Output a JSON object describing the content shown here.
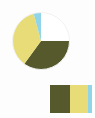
{
  "canvas": {
    "width": 95,
    "height": 118,
    "background_color": "#fdfdfd"
  },
  "pie_chart": {
    "name": "pie-chart",
    "center_x": 29,
    "center_y": 29,
    "radius": 28.5,
    "outline_color": "#f2f2f2"
  },
  "color_swatch_block": {
    "name": "color-swatch-block",
    "bands": [
      {
        "name": "swatch-olive",
        "color": "#55592b",
        "width_pct": 47.6
      },
      {
        "name": "swatch-yellow",
        "color": "#e8dc78",
        "width_pct": 42.9
      },
      {
        "name": "swatch-cyan",
        "color": "#8fd4e8",
        "width_pct": 9.5
      }
    ]
  },
  "chart_data": {
    "type": "pie",
    "title": "",
    "labels": [
      "Unfilled",
      "Olive",
      "Yellow",
      "Cyan"
    ],
    "values": [
      25,
      35,
      36,
      4
    ],
    "colors": [
      "#ffffff",
      "#55592b",
      "#e8dc78",
      "#8fd4e8"
    ],
    "slices": [
      {
        "label": "Unfilled",
        "color": "#ffffff",
        "value": 25,
        "start_angle": 0,
        "end_angle": 90
      },
      {
        "label": "Olive",
        "color": "#55592b",
        "value": 35,
        "start_angle": 90,
        "end_angle": 216
      },
      {
        "label": "Yellow",
        "color": "#e8dc78",
        "value": 36,
        "start_angle": 216,
        "end_angle": 345
      },
      {
        "label": "Cyan",
        "color": "#8fd4e8",
        "value": 4,
        "start_angle": 345,
        "end_angle": 360
      }
    ],
    "start_angle_deg": 0,
    "direction": "clockwise",
    "legend": "none",
    "grid": false,
    "xlabel": "",
    "ylabel": ""
  }
}
